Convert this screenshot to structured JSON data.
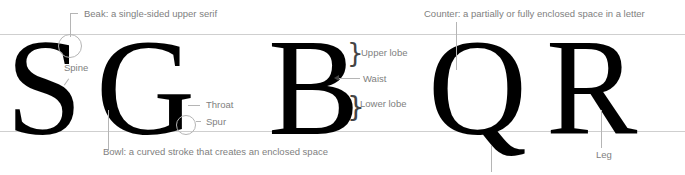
{
  "diagram": {
    "type": "typographic anatomy",
    "letters": [
      {
        "glyph": "S"
      },
      {
        "glyph": "G"
      },
      {
        "glyph": "B"
      },
      {
        "glyph": "Q"
      },
      {
        "glyph": "R"
      }
    ],
    "labels": {
      "beak": "Beak: a single-sided upper serif",
      "spine": "Spine",
      "throat": "Throat",
      "spur": "Spur",
      "bowl": "Bowl: a curved stroke that creates an enclosed space",
      "upper_lobe": "Upper lobe",
      "waist": "Waist",
      "lower_lobe": "Lower lobe",
      "counter": "Counter: a partially or fully enclosed space in a letter",
      "leg": "Leg"
    },
    "colors": {
      "glyph": "#000000",
      "label": "#808080",
      "guide": "#cfcfcf",
      "leader": "#b5b5b5"
    }
  }
}
